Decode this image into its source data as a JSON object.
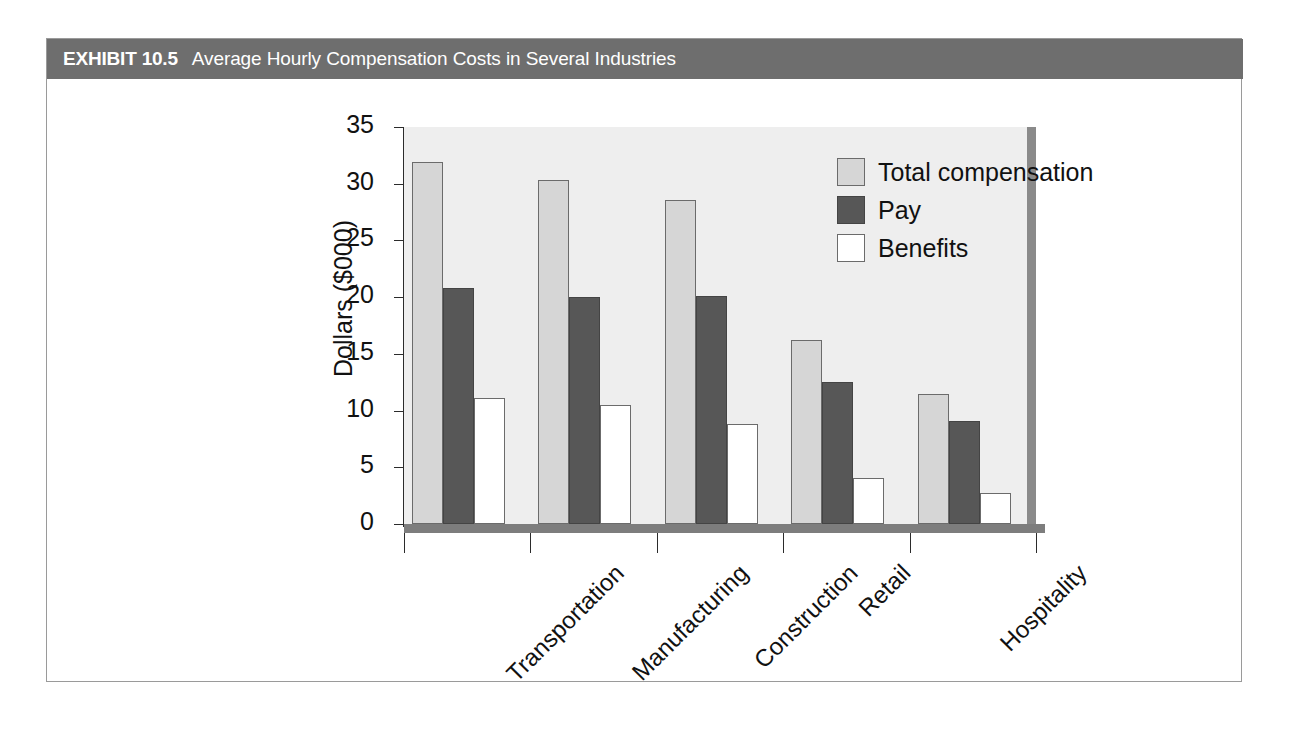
{
  "exhibit": {
    "label": "EXHIBIT 10.5",
    "title": "Average Hourly Compensation Costs in Several Industries",
    "header_color": "#6e6e6e"
  },
  "chart_data": {
    "type": "bar",
    "title": "Average Hourly Compensation Costs in Several Industries",
    "xlabel": "",
    "ylabel": "Dollars ($000)",
    "ylim": [
      0,
      35
    ],
    "yticks": [
      0,
      5,
      10,
      15,
      20,
      25,
      30,
      35
    ],
    "ytick_labels": [
      "0",
      "5",
      "10",
      "15",
      "20",
      "25",
      "30",
      "35"
    ],
    "grid": false,
    "legend_position": "top-right",
    "categories": [
      "Transportation",
      "Manufacturing",
      "Construction",
      "Retail",
      "Hospitality"
    ],
    "series": [
      {
        "name": "Total compensation",
        "color": "#d6d6d6",
        "values": [
          31.9,
          30.3,
          28.6,
          16.2,
          11.5
        ]
      },
      {
        "name": "Pay",
        "color": "#575757",
        "values": [
          20.8,
          20.0,
          20.1,
          12.5,
          9.1
        ]
      },
      {
        "name": "Benefits",
        "color": "#ffffff",
        "values": [
          11.1,
          10.5,
          8.8,
          4.1,
          2.7
        ]
      }
    ]
  }
}
